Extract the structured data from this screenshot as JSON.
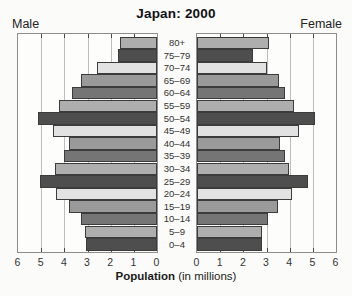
{
  "header": {
    "title": "Japan: 2000",
    "left_label": "Male",
    "right_label": "Female"
  },
  "axis": {
    "xlabel_bold": "Population",
    "xlabel_rest": " (in millions)",
    "male_tick_labels": [
      "6",
      "5",
      "4",
      "3",
      "2",
      "1",
      "0"
    ],
    "female_tick_labels": [
      "0",
      "1",
      "2",
      "3",
      "4",
      "5",
      "6"
    ]
  },
  "chart_data": {
    "type": "bar",
    "subtype": "population-pyramid",
    "title": "Japan: 2000",
    "xlabel": "Population (in millions)",
    "xlim": [
      0,
      6
    ],
    "grid": true,
    "categories": [
      "80+",
      "75–79",
      "70–74",
      "65–69",
      "60–64",
      "55–59",
      "50–54",
      "45–49",
      "40–44",
      "35–39",
      "30–34",
      "25–29",
      "20–24",
      "15–19",
      "10–14",
      "5–9",
      "0–4"
    ],
    "series": [
      {
        "name": "Male",
        "side": "left",
        "values": [
          1.6,
          1.7,
          2.6,
          3.3,
          3.65,
          4.25,
          5.15,
          4.5,
          3.8,
          4.0,
          4.4,
          5.05,
          4.35,
          3.8,
          3.3,
          3.1,
          3.05
        ]
      },
      {
        "name": "Female",
        "side": "right",
        "values": [
          3.1,
          2.4,
          3.0,
          3.55,
          3.8,
          4.2,
          5.1,
          4.4,
          3.6,
          3.8,
          3.95,
          4.8,
          4.1,
          3.5,
          3.05,
          2.8,
          2.8
        ]
      }
    ],
    "bar_colors_cycle": [
      "#aeaeae",
      "#4e4e4e",
      "#e2e2e2",
      "#9a9a9a",
      "#757575"
    ],
    "gridline_color": "#bdbdbd",
    "bar_border_color": "#3c3c3c"
  }
}
